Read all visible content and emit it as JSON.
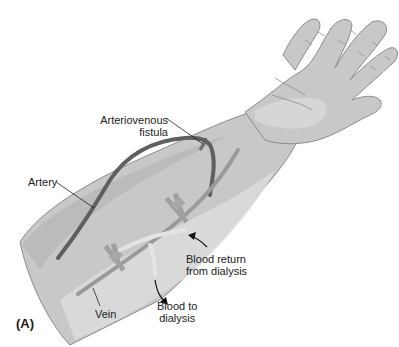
{
  "figure": {
    "panel_label": "(A)",
    "labels": {
      "fistula_line1": "Arteriovenous",
      "fistula_line2": "fistula",
      "artery": "Artery",
      "vein": "Vein",
      "return_line1": "Blood return",
      "return_line2": "from dialysis",
      "to_line1": "Blood to",
      "to_line2": "dialysis"
    },
    "colors": {
      "skin_base": "#c8c8c8",
      "skin_light": "#dadada",
      "skin_dark": "#b4b4b4",
      "outline": "#8c8c8c",
      "vessel": "#5f5f5f",
      "vein": "#9a9a9a",
      "needle_hub": "#a8a8a8",
      "tubing": "#e4e4e4",
      "text": "#222222"
    }
  }
}
